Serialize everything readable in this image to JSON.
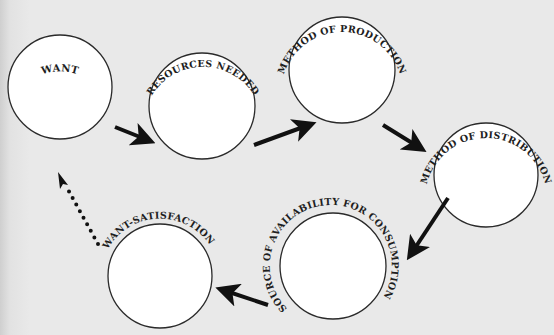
{
  "diagram": {
    "type": "cycle",
    "colors": {
      "background": "#e9e9e9",
      "circle_fill": "#ffffff",
      "stroke": "#2a2a2a",
      "arrow": "#111111"
    },
    "nodes": [
      {
        "id": "want",
        "label": "WANT",
        "cx": 60,
        "cy": 87,
        "r": 52
      },
      {
        "id": "resources",
        "label": "RESOURCES NEEDED",
        "cx": 202,
        "cy": 106,
        "r": 53
      },
      {
        "id": "production",
        "label": "METHOD OF PRODUCTION",
        "cx": 342,
        "cy": 70,
        "r": 53
      },
      {
        "id": "distribution",
        "label": "METHOD OF DISTRIBUTION",
        "cx": 486,
        "cy": 175,
        "r": 52
      },
      {
        "id": "source",
        "label": "SOURCE OF AVAILABILITY FOR CONSUMPTION",
        "cx": 333,
        "cy": 266,
        "r": 53
      },
      {
        "id": "satisfaction",
        "label": "WANT-SATISFACTION",
        "cx": 160,
        "cy": 276,
        "r": 52
      }
    ],
    "edges": [
      {
        "from": "want",
        "to": "resources",
        "style": "solid"
      },
      {
        "from": "resources",
        "to": "production",
        "style": "solid"
      },
      {
        "from": "production",
        "to": "distribution",
        "style": "solid"
      },
      {
        "from": "distribution",
        "to": "source",
        "style": "solid"
      },
      {
        "from": "source",
        "to": "satisfaction",
        "style": "solid"
      },
      {
        "from": "satisfaction",
        "to": "want",
        "style": "dotted"
      }
    ]
  }
}
